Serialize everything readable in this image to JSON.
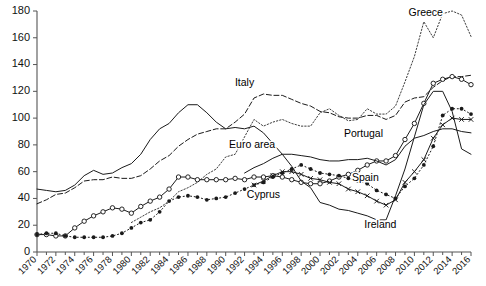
{
  "chart_data": {
    "type": "line",
    "title": "",
    "subtitle": "",
    "xlabel": "",
    "ylabel": "",
    "xlim": [
      1970,
      2016
    ],
    "ylim": [
      0,
      180
    ],
    "grid": false,
    "legend_position": "inline-labels",
    "y_ticks": [
      0,
      20,
      40,
      60,
      80,
      100,
      120,
      140,
      160,
      180
    ],
    "x_ticks": [
      1970,
      1972,
      1974,
      1976,
      1978,
      1980,
      1982,
      1984,
      1986,
      1988,
      1990,
      1992,
      1994,
      1996,
      1998,
      2000,
      2002,
      2004,
      2006,
      2008,
      2010,
      2012,
      2014,
      2016
    ],
    "x_tick_labels": [
      "1970",
      "1972",
      "1974",
      "1976",
      "1978",
      "1980",
      "1982",
      "1984",
      "1986",
      "1988",
      "1990",
      "1992",
      "1994",
      "1996",
      "1998",
      "2000",
      "2002",
      "2004",
      "2006",
      "2008",
      "2010",
      "2012",
      "2014",
      "2016"
    ],
    "x": [
      1970,
      1971,
      1972,
      1973,
      1974,
      1975,
      1976,
      1977,
      1978,
      1979,
      1980,
      1981,
      1982,
      1983,
      1984,
      1985,
      1986,
      1987,
      1988,
      1989,
      1990,
      1991,
      1992,
      1993,
      1994,
      1995,
      1996,
      1997,
      1998,
      1999,
      2000,
      2001,
      2002,
      2003,
      2004,
      2005,
      2006,
      2007,
      2008,
      2009,
      2010,
      2011,
      2012,
      2013,
      2014,
      2015,
      2016
    ],
    "series": [
      {
        "name": "Greece",
        "label": "Greece",
        "style": "fine-dotted",
        "marker": "none",
        "color": "#333333",
        "label_x": 2011.2,
        "label_y": 176,
        "values": [
          null,
          null,
          null,
          null,
          null,
          null,
          null,
          null,
          null,
          null,
          22,
          26,
          30,
          33,
          38,
          45,
          48,
          52,
          58,
          62,
          71,
          73,
          86,
          99,
          94,
          97,
          99,
          96,
          94,
          94,
          104,
          107,
          102,
          98,
          99,
          107,
          103,
          103,
          109,
          127,
          146,
          172,
          160,
          178,
          180,
          177,
          161
        ]
      },
      {
        "name": "Italy",
        "label": "Italy",
        "style": "dashed",
        "marker": "none",
        "color": "#333333",
        "label_x": 1992.0,
        "label_y": 124,
        "values": [
          36,
          39,
          43,
          44,
          48,
          53,
          54,
          54,
          56,
          55,
          55,
          57,
          62,
          68,
          72,
          79,
          84,
          88,
          90,
          92,
          92,
          97,
          103,
          115,
          118,
          117,
          117,
          114,
          111,
          109,
          105,
          104,
          101,
          100,
          100,
          102,
          102,
          99,
          102,
          112,
          115,
          116,
          123,
          128,
          131,
          131,
          132
        ]
      },
      {
        "name": "Portugal",
        "label": "Portugal",
        "style": "solid",
        "marker": "circle",
        "color": "#1a1a1a",
        "label_x": 2004.6,
        "label_y": 86,
        "values": [
          13,
          13,
          12,
          12,
          18,
          23,
          27,
          30,
          33,
          32,
          29,
          34,
          38,
          41,
          47,
          56,
          56,
          54,
          54,
          54,
          54,
          55,
          54,
          56,
          56,
          57,
          56,
          54,
          52,
          51,
          51,
          53,
          56,
          58,
          61,
          65,
          68,
          68,
          72,
          84,
          96,
          111,
          126,
          129,
          131,
          129,
          125
        ]
      },
      {
        "name": "Euro area",
        "label": "Euro area",
        "style": "solid",
        "marker": "none",
        "color": "#1a1a1a",
        "label_x": 1992.8,
        "label_y": 78,
        "values": [
          null,
          null,
          null,
          null,
          null,
          null,
          null,
          null,
          null,
          null,
          null,
          null,
          null,
          null,
          null,
          null,
          null,
          null,
          null,
          null,
          null,
          null,
          59,
          63,
          66,
          70,
          73,
          73,
          72,
          71,
          69,
          68,
          68,
          69,
          69,
          70,
          68,
          65,
          69,
          79,
          85,
          87,
          90,
          92,
          92,
          90,
          89
        ]
      },
      {
        "name": "Spain",
        "label": "Spain",
        "style": "solid",
        "marker": "x",
        "color": "#1a1a1a",
        "label_x": 2004.8,
        "label_y": 53,
        "values": [
          null,
          null,
          null,
          null,
          null,
          null,
          null,
          null,
          null,
          null,
          null,
          null,
          null,
          null,
          null,
          null,
          null,
          null,
          null,
          null,
          null,
          null,
          null,
          50,
          53,
          57,
          60,
          60,
          58,
          55,
          54,
          52,
          51,
          47,
          45,
          42,
          38,
          35,
          39,
          52,
          60,
          69,
          85,
          95,
          100,
          99,
          99
        ]
      },
      {
        "name": "Cyprus",
        "label": "Cyprus",
        "style": "dotted",
        "marker": "dot",
        "color": "#1a1a1a",
        "label_x": 1994.0,
        "label_y": 40,
        "values": [
          13,
          14,
          14,
          12,
          11,
          11,
          11,
          11,
          12,
          14,
          18,
          22,
          24,
          30,
          38,
          41,
          42,
          41,
          39,
          40,
          41,
          44,
          47,
          50,
          52,
          56,
          59,
          62,
          65,
          62,
          59,
          58,
          57,
          55,
          53,
          51,
          46,
          43,
          40,
          49,
          55,
          65,
          79,
          102,
          107,
          107,
          103
        ]
      },
      {
        "name": "Ireland",
        "label": "Ireland",
        "style": "solid",
        "marker": "none",
        "color": "#1a1a1a",
        "label_x": 2006.4,
        "label_y": 18,
        "values": [
          47,
          46,
          45,
          46,
          50,
          57,
          61,
          58,
          59,
          63,
          66,
          73,
          84,
          92,
          96,
          104,
          110,
          110,
          104,
          97,
          92,
          93,
          92,
          94,
          89,
          81,
          73,
          64,
          53,
          48,
          37,
          35,
          32,
          31,
          29,
          27,
          24,
          24,
          42,
          62,
          86,
          110,
          120,
          120,
          105,
          77,
          73
        ]
      }
    ]
  },
  "labels": {
    "greece": "Greece",
    "italy": "Italy",
    "portugal": "Portugal",
    "euro_area": "Euro area",
    "spain": "Spain",
    "cyprus": "Cyprus",
    "ireland": "Ireland"
  }
}
